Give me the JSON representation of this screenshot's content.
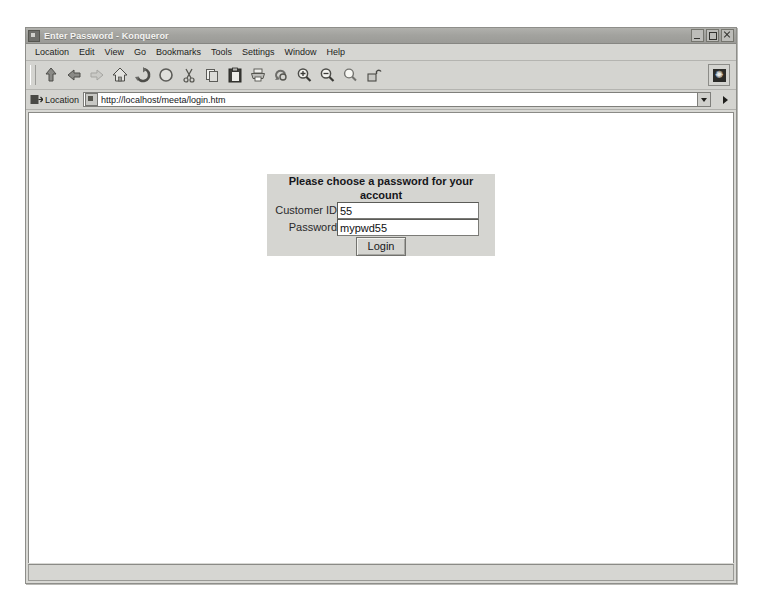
{
  "window": {
    "title": "Enter Password - Konqueror",
    "app_icon": "konqueror-icon",
    "controls": {
      "minimize": "Minimize",
      "maximize": "Maximize",
      "close": "Close"
    }
  },
  "menubar": {
    "items": [
      {
        "label": "Location"
      },
      {
        "label": "Edit"
      },
      {
        "label": "View"
      },
      {
        "label": "Go"
      },
      {
        "label": "Bookmarks"
      },
      {
        "label": "Tools"
      },
      {
        "label": "Settings"
      },
      {
        "label": "Window"
      },
      {
        "label": "Help"
      }
    ]
  },
  "toolbar": {
    "buttons": [
      {
        "name": "up-icon"
      },
      {
        "name": "back-icon"
      },
      {
        "name": "forward-icon"
      },
      {
        "name": "home-icon"
      },
      {
        "name": "reload-icon"
      },
      {
        "name": "stop-icon"
      },
      {
        "name": "cut-icon"
      },
      {
        "name": "copy-icon"
      },
      {
        "name": "paste-icon"
      },
      {
        "name": "print-icon"
      },
      {
        "name": "find-file-icon"
      },
      {
        "name": "zoom-in-icon"
      },
      {
        "name": "zoom-out-icon"
      },
      {
        "name": "find-icon"
      },
      {
        "name": "unlocked-padlock-icon"
      }
    ],
    "throbber": "konqueror-throbber"
  },
  "location_bar": {
    "label": "Location",
    "url": "http://localhost/meeta/login.htm",
    "placeholder": "Enter a location",
    "dropdown": "chevron-down-icon",
    "go": "go-arrow-icon"
  },
  "page": {
    "form": {
      "heading": "Please choose a password for your account",
      "fields": [
        {
          "label": "Customer ID",
          "value": "55",
          "placeholder": ""
        },
        {
          "label": "Password",
          "value": "mypwd55",
          "placeholder": ""
        }
      ],
      "submit_label": "Login"
    }
  },
  "statusbar": {
    "text": ""
  },
  "colors": {
    "panel_bg": "#d5d5d1",
    "window_bg": "#d8d8d4",
    "titlebar": "#a2a29e",
    "page_bg": "#ffffff",
    "text": "#18181a"
  }
}
